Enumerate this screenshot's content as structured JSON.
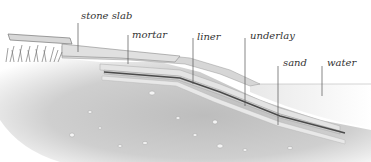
{
  "diagram": {
    "labels": [
      {
        "id": "stone-slab",
        "text": "stone slab"
      },
      {
        "id": "mortar",
        "text": "mortar"
      },
      {
        "id": "liner",
        "text": "liner"
      },
      {
        "id": "underlay",
        "text": "underlay"
      },
      {
        "id": "sand",
        "text": "sand"
      },
      {
        "id": "water",
        "text": "water"
      }
    ],
    "colors": {
      "background": "#ffffff",
      "soil": "#c9c9c9",
      "soil_dark": "#a8a8a8",
      "layer_light": "#e6e6e6",
      "liner": "#4a4a4a",
      "water": "#efefef",
      "leader_line": "#555555",
      "grass": "#777777"
    }
  }
}
